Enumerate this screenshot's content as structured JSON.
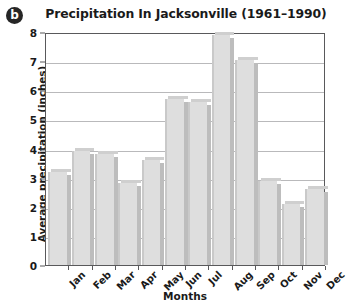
{
  "figure": {
    "badge_label": "b"
  },
  "axis": {
    "y_title": "Average precipitation (inches)",
    "x_title": "Months",
    "y_ticks": [
      "0",
      "1",
      "2",
      "3",
      "4",
      "5",
      "6",
      "7",
      "8"
    ]
  },
  "chart_data": {
    "type": "bar",
    "title": "Precipitation In Jacksonville (1961–1990)",
    "xlabel": "Months",
    "ylabel": "Average precipitation (inches)",
    "categories": [
      "Jan",
      "Feb",
      "Mar",
      "Apr",
      "May",
      "Jun",
      "Jul",
      "Aug",
      "Sep",
      "Oct",
      "Nov",
      "Dec"
    ],
    "values": [
      3.2,
      3.9,
      3.8,
      2.8,
      3.6,
      5.7,
      5.6,
      7.9,
      7.05,
      2.9,
      2.1,
      2.6
    ],
    "ylim": [
      0,
      8
    ],
    "ytick_step": 1,
    "grid": true,
    "legend": null,
    "bar_color": "#dcdcdc",
    "bar_edge_color": "#bdbdbd",
    "axis_color": "#59595b",
    "gridline_color": "#b9b9bb"
  }
}
